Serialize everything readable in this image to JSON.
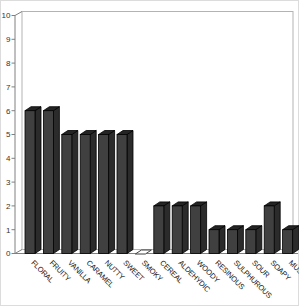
{
  "window": {
    "width": 299,
    "height": 306,
    "background": "#ffffff"
  },
  "chart_data": {
    "type": "bar",
    "subtype": "3d-column",
    "title": "",
    "xlabel": "",
    "ylabel": "",
    "categories": [
      "FLORAL",
      "FRUITY",
      "VANILLA",
      "CARAMEL",
      "NUTTY",
      "SWEET",
      "SMOKY",
      "CEREAL",
      "ALDEHYDIC",
      "WOODY",
      "RESINOUS",
      "SULPHUROUS",
      "SOUR",
      "SOAPY",
      "MUSTY"
    ],
    "values": [
      6,
      6,
      5,
      5,
      5,
      5,
      0,
      2,
      2,
      2,
      1,
      1,
      1,
      2,
      1
    ],
    "ylim": [
      0,
      10
    ],
    "ytick_step": 1,
    "yticks": [
      0,
      1,
      2,
      3,
      4,
      5,
      6,
      7,
      8,
      9,
      10
    ],
    "grid": false,
    "legend": false,
    "category_label_rotation_deg": 45
  },
  "colors": {
    "bar_front": "#404040",
    "bar_top": "#242424",
    "bar_side": "#2b2b2b",
    "bar_outline": "#000000",
    "zero_bar_fill": "#ffffff",
    "zero_bar_outline": "#3f3f3f",
    "axis_line": "#808080",
    "wall_border": "#b3b3b3",
    "wall_fill": "#ffffff",
    "tick_label": "#333333",
    "category_label": "#1a1a1a",
    "frame_border": "#dcdcdc",
    "background": "#ffffff"
  }
}
